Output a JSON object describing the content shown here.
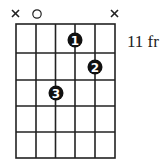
{
  "diagram": {
    "type": "guitar-chord-diagram",
    "fret_label": "11 fr",
    "strings": 6,
    "frets_shown": 5,
    "string_markers": [
      {
        "string": 1,
        "marker": "X"
      },
      {
        "string": 2,
        "marker": "O"
      },
      {
        "string": 3,
        "marker": ""
      },
      {
        "string": 4,
        "marker": ""
      },
      {
        "string": 5,
        "marker": ""
      },
      {
        "string": 6,
        "marker": "X"
      }
    ],
    "fingers": [
      {
        "finger": "1",
        "string": 4,
        "fret": 1
      },
      {
        "finger": "2",
        "string": 5,
        "fret": 2
      },
      {
        "finger": "3",
        "string": 3,
        "fret": 3
      }
    ],
    "colors": {
      "line": "#222222",
      "dot": "#111111",
      "dot_text": "#ffffff"
    }
  }
}
